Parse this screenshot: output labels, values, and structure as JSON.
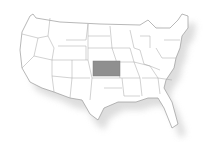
{
  "map": {
    "title": "United States",
    "highlighted_state": "Kansas",
    "colors": {
      "background": "#ffffff",
      "land": "#ffffff",
      "border": "#9a9a9a",
      "highlight": "#8f8f8f",
      "shadow": "#c8c8c8"
    }
  }
}
